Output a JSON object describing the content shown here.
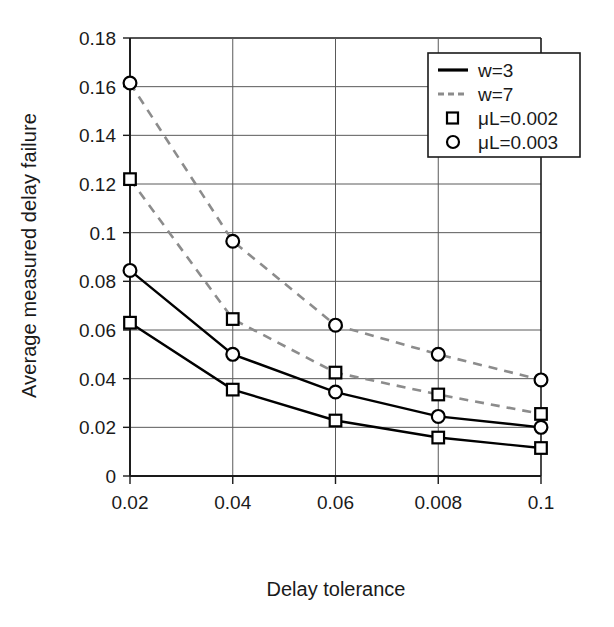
{
  "chart_data": {
    "type": "line",
    "title": "",
    "xlabel": "Delay tolerance",
    "ylabel": "Average measured delay failure",
    "x_tick_labels": [
      "0.02",
      "0.04",
      "0.06",
      "0.008",
      "0.1"
    ],
    "y_tick_labels": [
      "0",
      "0.02",
      "0.04",
      "0.06",
      "0.08",
      "0.1",
      "0.12",
      "0.14",
      "0.16",
      "0.18"
    ],
    "y_ticks": [
      0,
      0.02,
      0.04,
      0.06,
      0.08,
      0.1,
      0.12,
      0.14,
      0.16,
      0.18
    ],
    "ylim": [
      0,
      0.18
    ],
    "grid": true,
    "legend_position": "top-right",
    "categories": [
      "0.02",
      "0.04",
      "0.06",
      "0.008",
      "0.1"
    ],
    "series": [
      {
        "name": "w=7, μL=0.003",
        "line_style": "dashed",
        "color": "#8c8c8c",
        "marker": "circle",
        "marker_color": "#000000",
        "values": [
          0.1615,
          0.0965,
          0.062,
          0.05,
          0.0395
        ]
      },
      {
        "name": "w=7, μL=0.002",
        "line_style": "dashed",
        "color": "#8c8c8c",
        "marker": "square",
        "marker_color": "#000000",
        "values": [
          0.122,
          0.0645,
          0.0425,
          0.0335,
          0.0255
        ]
      },
      {
        "name": "w=3, μL=0.003",
        "line_style": "solid",
        "color": "#000000",
        "marker": "circle",
        "marker_color": "#000000",
        "values": [
          0.0845,
          0.05,
          0.0345,
          0.0245,
          0.02
        ]
      },
      {
        "name": "w=3, μL=0.002",
        "line_style": "solid",
        "color": "#000000",
        "marker": "square",
        "marker_color": "#000000",
        "values": [
          0.063,
          0.0355,
          0.0228,
          0.0158,
          0.0115
        ]
      }
    ],
    "legend_entries": [
      {
        "label": "w=3",
        "kind": "line",
        "style": "solid",
        "color": "#000000"
      },
      {
        "label": "w=7",
        "kind": "line",
        "style": "dashed",
        "color": "#8c8c8c"
      },
      {
        "label": "μL=0.002",
        "kind": "marker",
        "marker": "square",
        "color": "#000000"
      },
      {
        "label": "μL=0.003",
        "kind": "marker",
        "marker": "circle",
        "color": "#000000"
      }
    ]
  }
}
